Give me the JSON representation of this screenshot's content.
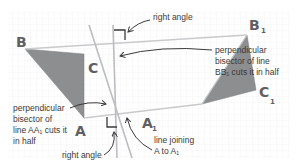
{
  "diagram": {
    "colors": {
      "background": "#ffffff",
      "grid": "#ececec",
      "triangle_fill": "#8d8e90",
      "line": "#c9cacc",
      "bisector": "#bcbdc0",
      "right_angle_mark": "#3a3a3a",
      "arrow": "#3a3a3a",
      "vertex_text": "#5f6063",
      "annotation_text": "#3a3a3a"
    },
    "vertices": {
      "B": {
        "letter": "B",
        "sub": ""
      },
      "C": {
        "letter": "C",
        "sub": ""
      },
      "A": {
        "letter": "A",
        "sub": ""
      },
      "B1": {
        "letter": "B",
        "sub": "1"
      },
      "C1": {
        "letter": "C",
        "sub": "1"
      },
      "A1": {
        "letter": "A",
        "sub": "1"
      }
    },
    "annotations": {
      "right_angle_top": "right angle",
      "bisector_bb1": [
        "perpendicular",
        "bisector of line",
        "BB₁ cuts it in half"
      ],
      "bisector_aa1": [
        "perpendicular",
        "bisector of",
        "line AA₁ cuts it",
        "in half"
      ],
      "right_angle_bottom": "right angle",
      "line_joining": [
        "line joining",
        "A to A₁"
      ]
    }
  }
}
